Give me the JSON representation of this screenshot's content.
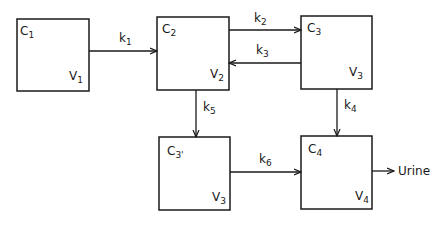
{
  "diagram": {
    "title": "",
    "compartments": [
      {
        "id": "c1",
        "conc": "C",
        "conc_sub": "1",
        "vol": "V",
        "vol_sub": "1"
      },
      {
        "id": "c2",
        "conc": "C",
        "conc_sub": "2",
        "vol": "V",
        "vol_sub": "2"
      },
      {
        "id": "c3",
        "conc": "C",
        "conc_sub": "3",
        "vol": "V",
        "vol_sub": "3"
      },
      {
        "id": "c3p",
        "conc": "C",
        "conc_sub": "3'",
        "vol": "V",
        "vol_sub": "3"
      },
      {
        "id": "c4",
        "conc": "C",
        "conc_sub": "4",
        "vol": "V",
        "vol_sub": "4"
      }
    ],
    "rates": [
      {
        "id": "k1",
        "label": "k",
        "sub": "1",
        "from": "c1",
        "to": "c2"
      },
      {
        "id": "k2",
        "label": "k",
        "sub": "2",
        "from": "c2",
        "to": "c3"
      },
      {
        "id": "k3",
        "label": "k",
        "sub": "3",
        "from": "c3",
        "to": "c2"
      },
      {
        "id": "k4",
        "label": "k",
        "sub": "4",
        "from": "c3",
        "to": "c4"
      },
      {
        "id": "k5",
        "label": "k",
        "sub": "5",
        "from": "c2",
        "to": "c3p"
      },
      {
        "id": "k6",
        "label": "k",
        "sub": "6",
        "from": "c3p",
        "to": "c4"
      }
    ],
    "output": {
      "label": "Urine",
      "from": "c4"
    },
    "colors": {
      "line": "#1a1a1a",
      "background": "#ffffff"
    }
  }
}
